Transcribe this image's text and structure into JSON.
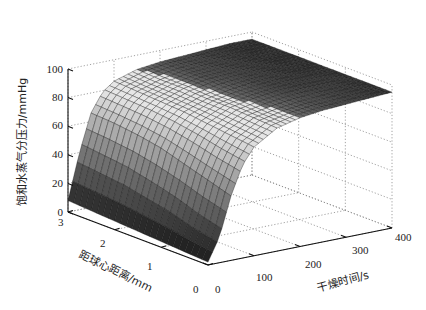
{
  "chart_data": {
    "type": "surface3d",
    "title": "",
    "xlabel": "距球心距离/mm",
    "ylabel": "干燥时间/s",
    "zlabel": "饱和水蒸气分压力/mmHg",
    "x_axis": {
      "name": "radius_mm",
      "range": [
        0,
        3
      ],
      "ticks": [
        0,
        1,
        2,
        3
      ]
    },
    "y_axis": {
      "name": "time_s",
      "range": [
        0,
        400
      ],
      "ticks": [
        0,
        100,
        200,
        300,
        400
      ]
    },
    "z_axis": {
      "name": "pressure_mmHg",
      "range": [
        0,
        100
      ],
      "ticks": [
        0,
        20,
        40,
        60,
        80,
        100
      ]
    },
    "grid": true,
    "colormap": "gray",
    "radius_samples": [
      0,
      0.5,
      1.0,
      1.5,
      2.0,
      2.5,
      3.0
    ],
    "time_samples": [
      0,
      25,
      50,
      75,
      100,
      150,
      200,
      250,
      300,
      350,
      400
    ],
    "z_values_by_radius": [
      [
        2,
        18,
        45,
        65,
        76,
        86,
        90,
        92,
        93,
        94,
        95
      ],
      [
        3,
        22,
        50,
        68,
        78,
        87,
        90,
        92,
        93,
        94,
        95
      ],
      [
        4,
        28,
        55,
        72,
        80,
        88,
        91,
        93,
        94,
        94,
        95
      ],
      [
        5,
        32,
        60,
        75,
        82,
        88,
        91,
        93,
        94,
        95,
        95
      ],
      [
        6,
        36,
        63,
        77,
        83,
        89,
        92,
        93,
        94,
        95,
        95
      ],
      [
        7,
        38,
        65,
        78,
        84,
        89,
        92,
        93,
        94,
        95,
        95
      ],
      [
        8,
        40,
        66,
        79,
        85,
        90,
        92,
        93,
        94,
        95,
        95
      ]
    ]
  },
  "axes_text": {
    "z_ticks": [
      "0",
      "20",
      "40",
      "60",
      "80",
      "100"
    ],
    "x_ticks": [
      "0",
      "1",
      "2",
      "3"
    ],
    "y_ticks": [
      "0",
      "100",
      "200",
      "300",
      "400"
    ],
    "xlabel": "距球心距离/mm",
    "ylabel": "干燥时间/s",
    "zlabel": "饱和水蒸气分压力/mmHg"
  }
}
